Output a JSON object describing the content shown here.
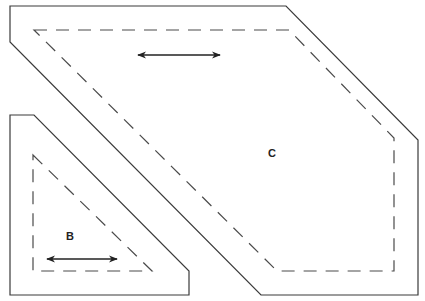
{
  "diagram": {
    "type": "quilt-pattern-template",
    "pieces": [
      {
        "id": "C",
        "label": "C",
        "shape": "irregular hexagon",
        "cut_line": [
          [
            10,
            6
          ],
          [
            286,
            6
          ],
          [
            418,
            140
          ],
          [
            418,
            295
          ],
          [
            261,
            295
          ],
          [
            10,
            42
          ]
        ],
        "seam_line": [
          [
            34,
            30
          ],
          [
            289,
            30
          ],
          [
            394,
            138
          ],
          [
            394,
            271
          ],
          [
            277,
            271
          ],
          [
            34,
            30
          ]
        ],
        "grain_arrow": {
          "x1": 138,
          "y1": 55,
          "x2": 220,
          "y2": 55,
          "direction": "horizontal double-headed"
        },
        "label_pos": [
          272,
          157
        ]
      },
      {
        "id": "B",
        "label": "B",
        "shape": "pentagon (clipped triangle)",
        "cut_line": [
          [
            10,
            115
          ],
          [
            34,
            115
          ],
          [
            189,
            271
          ],
          [
            189,
            295
          ],
          [
            10,
            295
          ]
        ],
        "seam_line": [
          [
            33,
            155
          ],
          [
            152,
            271
          ],
          [
            33,
            271
          ]
        ],
        "grain_arrow": {
          "x1": 47,
          "y1": 259,
          "x2": 117,
          "y2": 259,
          "direction": "horizontal double-headed"
        },
        "label_pos": [
          70,
          240
        ]
      }
    ],
    "colors": {
      "line": "#3a3a3a",
      "background": "#ffffff"
    }
  }
}
